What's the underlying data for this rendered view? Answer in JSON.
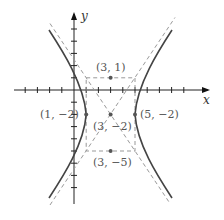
{
  "diagram": {
    "type": "hyperbola",
    "axes": {
      "x_label": "x",
      "y_label": "y"
    },
    "center": {
      "label": "(3, −2)",
      "x": 3,
      "y": -2
    },
    "vertices": [
      {
        "label": "(1, −2)",
        "x": 1,
        "y": -2
      },
      {
        "label": "(5, −2)",
        "x": 5,
        "y": -2
      }
    ],
    "co_vertices": [
      {
        "label": "(3, 1)",
        "x": 3,
        "y": 1
      },
      {
        "label": "(3, −5)",
        "x": 3,
        "y": -5
      }
    ],
    "colors": {
      "curve": "#444444",
      "dashed": "#999999",
      "axis": "#222222",
      "label": "#555555"
    }
  }
}
